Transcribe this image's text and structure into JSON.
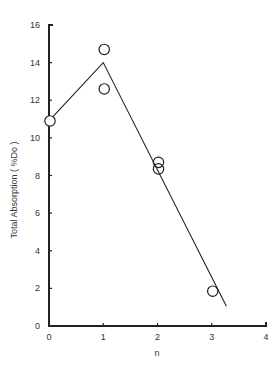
{
  "chart_data": {
    "type": "scatter",
    "title": "",
    "xlabel": "n",
    "ylabel": "Total Absorption  ( %Do )",
    "xlim": [
      0,
      4
    ],
    "ylim": [
      0,
      16
    ],
    "x_ticks": [
      0,
      1,
      2,
      3,
      4
    ],
    "y_ticks": [
      0,
      2,
      4,
      6,
      8,
      10,
      12,
      14,
      16
    ],
    "grid": false,
    "legend": null,
    "series": [
      {
        "name": "measured",
        "marker": "open-circle",
        "points": [
          {
            "x": 0,
            "y": 10.9
          },
          {
            "x": 1,
            "y": 14.7
          },
          {
            "x": 1,
            "y": 12.6
          },
          {
            "x": 2,
            "y": 8.7
          },
          {
            "x": 2,
            "y": 8.35
          },
          {
            "x": 3,
            "y": 1.85
          }
        ]
      },
      {
        "name": "fit",
        "type": "line",
        "points": [
          {
            "x": 0,
            "y": 10.9
          },
          {
            "x": 1,
            "y": 14.0
          },
          {
            "x": 3.27,
            "y": 1.05
          }
        ]
      }
    ]
  },
  "colors": {
    "ink": "#222222",
    "background": "#ffffff"
  }
}
